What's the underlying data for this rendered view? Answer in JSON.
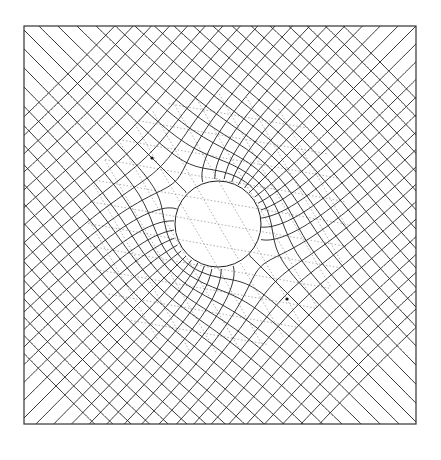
{
  "figure": {
    "frame": {
      "x0": 24,
      "y0": 26,
      "x1": 416,
      "y1": 424
    },
    "circle": {
      "cx": 218,
      "cy": 224,
      "r": 43
    },
    "stagnation_points": [
      {
        "name": "upper-left",
        "x": 152,
        "y": 158
      },
      {
        "name": "lower-right",
        "x": 287,
        "y": 299
      }
    ],
    "flow_angle_deg": 45,
    "mesh": {
      "stream_lines": 34,
      "potential_lines": 34,
      "spacing": 13,
      "stroke_color": "#222222",
      "stroke_width": 0.9
    },
    "dotted_grid": {
      "angle_deg": 60,
      "spacing": 22,
      "extent_radius": 130,
      "stroke_color": "#9a9a9a",
      "dash": "1.5 2"
    },
    "colors": {
      "background": "#ffffff",
      "frame": "#333333",
      "circle_fill": "#ffffff"
    }
  }
}
